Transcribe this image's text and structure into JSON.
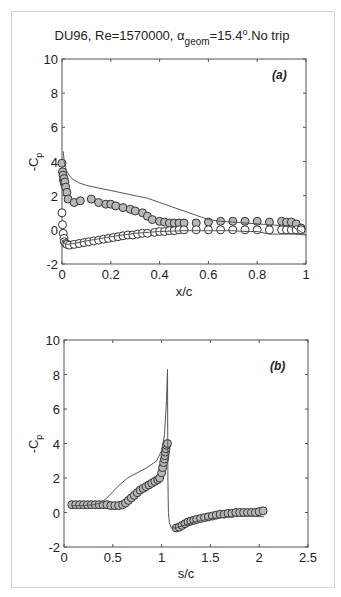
{
  "figure": {
    "title_main": "DU96, Re=1570000, α",
    "title_sub": "geom",
    "title_rest": "=15.4",
    "title_sup": "o",
    "title_end": ".No trip"
  },
  "chart_data": [
    {
      "type": "scatter",
      "panel_label": "(a)",
      "title": "DU96, Re=1570000, α_geom=15.4°.No trip",
      "xlabel": "x/c",
      "ylabel": "-C_p",
      "xlim": [
        0,
        1
      ],
      "ylim": [
        -2,
        10
      ],
      "xticks": [
        0,
        0.2,
        0.4,
        0.6,
        0.8,
        1
      ],
      "xtick_labels": [
        "0",
        "0.2",
        "0.4",
        "0.6",
        "0.8",
        "1"
      ],
      "yticks": [
        -2,
        0,
        2,
        4,
        6,
        8,
        10
      ],
      "ytick_labels": [
        "-2",
        "0",
        "2",
        "4",
        "6",
        "8",
        "10"
      ],
      "grid": false,
      "series": [
        {
          "name": "Suction side (experiment)",
          "style": "markers-filled-gray",
          "x": [
            0.0,
            0.002,
            0.004,
            0.006,
            0.008,
            0.01,
            0.012,
            0.015,
            0.02,
            0.025,
            0.05,
            0.075,
            0.12,
            0.15,
            0.18,
            0.2,
            0.22,
            0.25,
            0.28,
            0.3,
            0.33,
            0.35,
            0.37,
            0.4,
            0.42,
            0.44,
            0.46,
            0.48,
            0.5,
            0.55,
            0.6,
            0.65,
            0.7,
            0.75,
            0.8,
            0.85,
            0.9,
            0.92,
            0.94,
            0.96,
            0.98
          ],
          "y": [
            3.9,
            3.4,
            3.2,
            2.9,
            3.0,
            2.7,
            2.8,
            2.5,
            2.2,
            1.8,
            1.6,
            1.7,
            1.8,
            1.6,
            1.5,
            1.5,
            1.4,
            1.3,
            1.2,
            1.1,
            1.0,
            0.8,
            0.6,
            0.5,
            0.45,
            0.4,
            0.4,
            0.4,
            0.4,
            0.4,
            0.45,
            0.5,
            0.5,
            0.5,
            0.5,
            0.45,
            0.5,
            0.45,
            0.45,
            0.35,
            0.1
          ]
        },
        {
          "name": "Pressure side (experiment)",
          "style": "markers-open",
          "x": [
            0.0,
            0.002,
            0.005,
            0.008,
            0.01,
            0.015,
            0.02,
            0.03,
            0.05,
            0.07,
            0.09,
            0.11,
            0.13,
            0.15,
            0.17,
            0.19,
            0.21,
            0.23,
            0.25,
            0.27,
            0.29,
            0.31,
            0.33,
            0.35,
            0.38,
            0.4,
            0.42,
            0.44,
            0.46,
            0.48,
            0.5,
            0.55,
            0.6,
            0.65,
            0.7,
            0.75,
            0.8,
            0.85,
            0.9,
            0.92,
            0.94,
            0.96,
            0.98
          ],
          "y": [
            1.0,
            0.3,
            -0.2,
            -0.5,
            -0.7,
            -0.8,
            -0.85,
            -0.9,
            -0.85,
            -0.8,
            -0.75,
            -0.7,
            -0.65,
            -0.6,
            -0.55,
            -0.5,
            -0.45,
            -0.4,
            -0.35,
            -0.3,
            -0.3,
            -0.25,
            -0.2,
            -0.2,
            -0.15,
            -0.1,
            -0.1,
            -0.05,
            -0.05,
            0.0,
            0.0,
            0.0,
            0.0,
            0.0,
            0.0,
            0.0,
            0.0,
            0.0,
            0.0,
            0.0,
            0.0,
            0.0,
            0.0
          ]
        },
        {
          "name": "Computed suction side",
          "style": "line",
          "x": [
            0.005,
            0.01,
            0.02,
            0.04,
            0.07,
            0.1,
            0.15,
            0.2,
            0.25,
            0.3,
            0.35,
            0.4,
            0.45,
            0.5,
            0.55,
            0.6,
            0.65,
            0.7,
            0.75,
            0.8,
            0.85,
            0.9,
            0.95,
            1.0
          ],
          "y": [
            4.6,
            3.9,
            3.4,
            3.0,
            2.75,
            2.6,
            2.45,
            2.3,
            2.15,
            2.0,
            1.85,
            1.6,
            1.35,
            1.1,
            0.85,
            0.6,
            0.5,
            0.45,
            0.4,
            0.35,
            0.3,
            0.25,
            0.15,
            -0.3
          ]
        },
        {
          "name": "Computed pressure side",
          "style": "line",
          "x": [
            0.005,
            0.01,
            0.02,
            0.05,
            0.1,
            0.2,
            0.3,
            0.4,
            0.5,
            0.6,
            0.7,
            0.75,
            0.8,
            0.85,
            0.9,
            0.95,
            1.0
          ],
          "y": [
            -0.6,
            -0.8,
            -0.85,
            -0.8,
            -0.65,
            -0.4,
            -0.2,
            -0.1,
            -0.05,
            -0.05,
            -0.05,
            -0.1,
            -0.1,
            -0.25,
            -0.25,
            -0.25,
            -0.3
          ]
        }
      ]
    },
    {
      "type": "scatter",
      "panel_label": "(b)",
      "xlabel": "s/c",
      "ylabel": "-C_p",
      "xlim": [
        0,
        2.5
      ],
      "ylim": [
        -2,
        10
      ],
      "xticks": [
        0,
        0.5,
        1,
        1.5,
        2,
        2.5
      ],
      "xtick_labels": [
        "0",
        "0.5",
        "1",
        "1.5",
        "2",
        "2.5"
      ],
      "yticks": [
        -2,
        0,
        2,
        4,
        6,
        8,
        10
      ],
      "ytick_labels": [
        "-2",
        "0",
        "2",
        "4",
        "6",
        "8",
        "10"
      ],
      "grid": false,
      "series": [
        {
          "name": "Experiment (along surface)",
          "style": "markers-gray",
          "x": [
            0.08,
            0.12,
            0.16,
            0.2,
            0.24,
            0.28,
            0.32,
            0.36,
            0.4,
            0.44,
            0.48,
            0.52,
            0.56,
            0.6,
            0.63,
            0.66,
            0.69,
            0.72,
            0.75,
            0.78,
            0.81,
            0.84,
            0.87,
            0.9,
            0.93,
            0.96,
            0.98,
            1.0,
            1.01,
            1.02,
            1.03,
            1.035,
            1.04,
            1.045,
            1.05,
            1.06,
            1.15,
            1.18,
            1.21,
            1.24,
            1.27,
            1.3,
            1.33,
            1.36,
            1.4,
            1.44,
            1.48,
            1.52,
            1.56,
            1.6,
            1.64,
            1.68,
            1.72,
            1.76,
            1.8,
            1.84,
            1.88,
            1.92,
            1.96,
            2.0,
            2.04
          ],
          "y": [
            0.45,
            0.45,
            0.45,
            0.45,
            0.45,
            0.45,
            0.45,
            0.45,
            0.45,
            0.45,
            0.4,
            0.4,
            0.4,
            0.45,
            0.55,
            0.7,
            0.85,
            1.0,
            1.15,
            1.3,
            1.4,
            1.5,
            1.6,
            1.7,
            1.8,
            1.9,
            2.0,
            2.3,
            2.6,
            2.9,
            3.1,
            3.3,
            3.5,
            3.7,
            3.9,
            4.0,
            -0.9,
            -0.85,
            -0.75,
            -0.65,
            -0.55,
            -0.5,
            -0.45,
            -0.4,
            -0.35,
            -0.3,
            -0.25,
            -0.2,
            -0.15,
            -0.1,
            -0.1,
            -0.05,
            -0.05,
            0.0,
            0.0,
            0.0,
            0.0,
            0.0,
            0.0,
            0.05,
            0.1
          ]
        },
        {
          "name": "Computed",
          "style": "line",
          "x": [
            0.08,
            0.2,
            0.3,
            0.38,
            0.45,
            0.55,
            0.65,
            0.75,
            0.85,
            0.95,
            1.0,
            1.03,
            1.05,
            1.06,
            1.065,
            1.07,
            1.08,
            1.1,
            1.15,
            1.2,
            1.3,
            1.5,
            1.7,
            1.9,
            2.05
          ],
          "y": [
            0.4,
            0.4,
            0.45,
            0.55,
            0.9,
            1.5,
            2.0,
            2.3,
            2.6,
            3.0,
            3.6,
            4.5,
            6.5,
            8.3,
            2.0,
            0.0,
            -0.6,
            -0.9,
            -0.9,
            -0.8,
            -0.6,
            -0.35,
            -0.25,
            -0.2,
            -0.25
          ]
        }
      ]
    }
  ]
}
